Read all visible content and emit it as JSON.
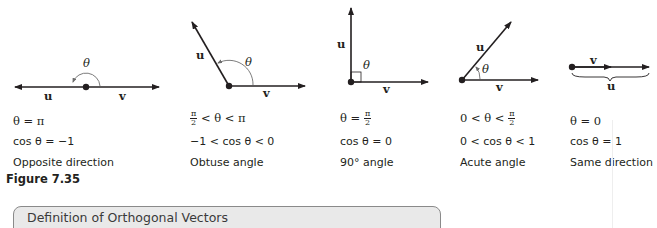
{
  "figure": {
    "caption": "Figure 7.35",
    "panels": [
      {
        "id": "opposite",
        "vector_labels": {
          "u": "u",
          "v": "v"
        },
        "angle_symbol": "θ",
        "theta_relation": "θ = π",
        "cos_relation": "cos θ = −1",
        "description": "Opposite direction"
      },
      {
        "id": "obtuse",
        "vector_labels": {
          "u": "u",
          "v": "v"
        },
        "angle_symbol": "θ",
        "theta_relation_parts": {
          "num": "π",
          "den": "2",
          "rest": " < θ < π"
        },
        "cos_relation": "−1 < cos θ < 0",
        "description": "Obtuse angle"
      },
      {
        "id": "right",
        "vector_labels": {
          "u": "u",
          "v": "v"
        },
        "angle_symbol": "θ",
        "theta_relation_parts": {
          "lead": "θ = ",
          "num": "π",
          "den": "2"
        },
        "cos_relation": "cos θ = 0",
        "description": "90° angle"
      },
      {
        "id": "acute",
        "vector_labels": {
          "u": "u",
          "v": "v"
        },
        "angle_symbol": "θ",
        "theta_relation_parts": {
          "lead": "0 < θ < ",
          "num": "π",
          "den": "2"
        },
        "cos_relation": "0 < cos θ < 1",
        "description": "Acute angle"
      },
      {
        "id": "same",
        "vector_labels": {
          "u": "u",
          "v": "v"
        },
        "theta_relation": "θ = 0",
        "cos_relation": "cos θ = 1",
        "description": "Same direction"
      }
    ]
  },
  "definition_box": {
    "title": "Definition of Orthogonal Vectors"
  },
  "colors": {
    "ink": "#231f20",
    "arc": "#6d6d6d",
    "box_fill": "#e9e9e9",
    "box_border": "#8a8a8a"
  }
}
